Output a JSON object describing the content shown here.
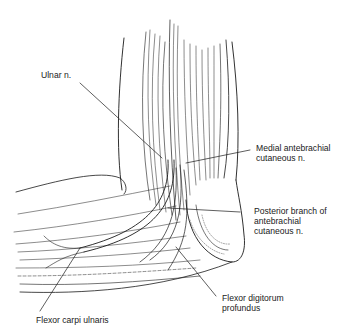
{
  "figure": {
    "labels": [
      {
        "id": "ulnar",
        "text": "Ulnar n.",
        "lines": [
          "Ulnar n."
        ]
      },
      {
        "id": "medial-antebrachial",
        "text": "Medial antebrachial cutaneous n.",
        "lines": [
          "Medial antebrachial",
          "cutaneous n."
        ]
      },
      {
        "id": "posterior-branch",
        "text": "Posterior branch of antebrachial cutaneous n.",
        "lines": [
          "Posterior branch of",
          "antebrachial",
          "cutaneous n."
        ]
      },
      {
        "id": "fdp",
        "text": "Flexor digitorum profundus",
        "lines": [
          "Flexor digitorum",
          "profundus"
        ]
      },
      {
        "id": "fcu",
        "text": "Flexor carpi ulnaris",
        "lines": [
          "Flexor carpi ulnaris"
        ]
      }
    ],
    "colors": {
      "line": "#1a1a1a",
      "background": "#ffffff"
    }
  }
}
